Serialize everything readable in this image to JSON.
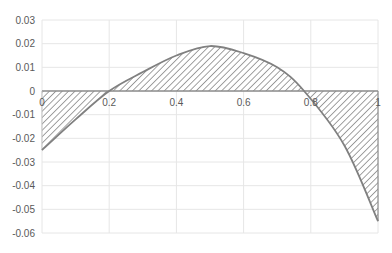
{
  "chart_data": {
    "type": "area",
    "title": "",
    "xlabel": "",
    "ylabel": "",
    "xlim": [
      0,
      1
    ],
    "ylim": [
      -0.06,
      0.03
    ],
    "grid": true,
    "legend": "none",
    "x_ticks": [
      "0",
      "0.2",
      "0.4",
      "0.6",
      "0.8",
      "1"
    ],
    "y_ticks": [
      "0.03",
      "0.02",
      "0.01",
      "0",
      "-0.01",
      "-0.02",
      "-0.03",
      "-0.04",
      "-0.05",
      "-0.06"
    ],
    "series": [
      {
        "name": "error curve (hatched area to zero line)",
        "x": [
          0,
          0.1,
          0.2,
          0.3,
          0.4,
          0.5,
          0.6,
          0.7,
          0.78,
          0.9,
          1.0
        ],
        "values": [
          -0.025,
          -0.012,
          0.0,
          0.008,
          0.015,
          0.019,
          0.016,
          0.01,
          0.0,
          -0.023,
          -0.055
        ]
      }
    ],
    "fill": "diagonal hatch, gray",
    "line_color": "#808080",
    "grid_color": "#e6e6e6"
  }
}
